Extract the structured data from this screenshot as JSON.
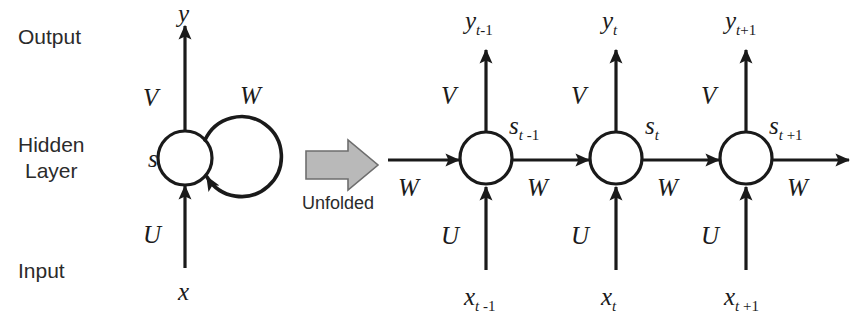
{
  "figure": {
    "background_color": "#ffffff",
    "stroke_color": "#1a1a1a",
    "text_color": "#2b2b2b",
    "block_arrow_fill": "#b9b9b9",
    "block_arrow_stroke": "#6e6e6e"
  },
  "row_labels": {
    "output": "Output",
    "hidden_line1": "Hidden",
    "hidden_line2": "Layer",
    "input": "Input"
  },
  "folded": {
    "output_var": "y",
    "state_var": "s",
    "input_var": "x",
    "weight_output": "V",
    "weight_input": "U",
    "weight_recurrent": "W"
  },
  "transition": {
    "label": "Unfolded",
    "arrow_direction": "right"
  },
  "unfolded": {
    "weight_output": "V",
    "weight_input": "U",
    "weight_recurrent": "W",
    "steps": [
      {
        "id": "t-minus-1",
        "output_base": "y",
        "output_sub_var": "t",
        "output_sub_num": "-1",
        "state_base": "s",
        "state_sub_var": "t",
        "state_sub_num": " -1",
        "input_base": "x",
        "input_sub_var": "t",
        "input_sub_num": " -1",
        "weight_output": "V",
        "weight_input": "U",
        "weight_recurrent_out": "W"
      },
      {
        "id": "t",
        "output_base": "y",
        "output_sub_var": "t",
        "output_sub_num": "",
        "state_base": "s",
        "state_sub_var": "t",
        "state_sub_num": "",
        "input_base": "x",
        "input_sub_var": "t",
        "input_sub_num": "",
        "weight_output": "V",
        "weight_input": "U",
        "weight_recurrent_out": "W"
      },
      {
        "id": "t-plus-1",
        "output_base": "y",
        "output_sub_var": "t",
        "output_sub_num": "+1",
        "state_base": "s",
        "state_sub_var": "t",
        "state_sub_num": " +1",
        "input_base": "x",
        "input_sub_var": "t",
        "input_sub_num": " +1",
        "weight_output": "V",
        "weight_input": "U",
        "weight_recurrent_out": "W"
      }
    ],
    "incoming_w_label": "W"
  }
}
